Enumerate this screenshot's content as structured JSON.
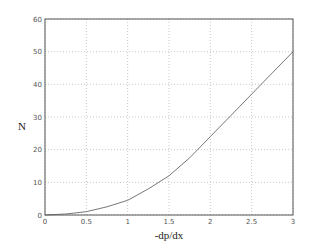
{
  "chart_data": {
    "type": "line",
    "title": "",
    "xlabel": "-dp/dx",
    "ylabel": "N",
    "xlim": [
      0,
      3
    ],
    "ylim": [
      0,
      60
    ],
    "grid": true,
    "legend": null,
    "x_ticks": [
      "0",
      "0.5",
      "1",
      "1.5",
      "2",
      "2.5",
      "3"
    ],
    "y_ticks": [
      "0",
      "10",
      "20",
      "30",
      "40",
      "50",
      "60"
    ],
    "series": [
      {
        "name": "N",
        "color": "#777777",
        "x": [
          0,
          0.25,
          0.5,
          0.75,
          1.0,
          1.25,
          1.5,
          1.75,
          2.0,
          2.25,
          2.5,
          2.75,
          3.0
        ],
        "y": [
          0,
          0.3,
          1.0,
          2.5,
          4.5,
          8.0,
          12.0,
          17.5,
          24.0,
          30.5,
          37.0,
          43.5,
          50.0
        ]
      }
    ]
  },
  "colors": {
    "axis": "#555555",
    "grid": "#bbbbbb",
    "line": "#777777"
  }
}
